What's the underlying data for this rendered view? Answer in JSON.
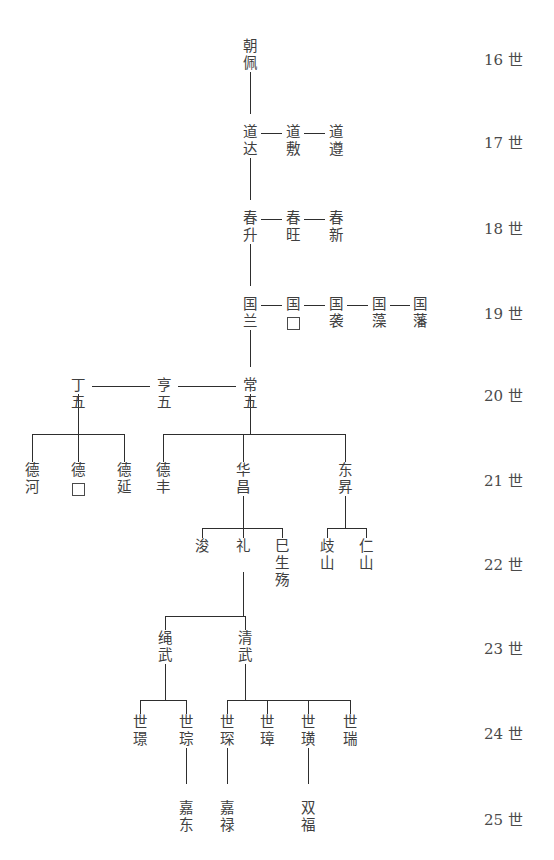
{
  "chart": {
    "type": "genealogy-tree",
    "line_color": "#2e2e2e",
    "text_color": "#3f3f3f",
    "background": "#ffffff"
  },
  "generation_labels": [
    {
      "id": "gen16",
      "text": "16 世",
      "y": 48
    },
    {
      "id": "gen17",
      "text": "17 世",
      "y": 131
    },
    {
      "id": "gen18",
      "text": "18 世",
      "y": 217
    },
    {
      "id": "gen19",
      "text": "19 世",
      "y": 302
    },
    {
      "id": "gen20",
      "text": "20 世",
      "y": 384
    },
    {
      "id": "gen21",
      "text": "21 世",
      "y": 469
    },
    {
      "id": "gen22",
      "text": "22 世",
      "y": 553
    },
    {
      "id": "gen23",
      "text": "23 世",
      "y": 637
    },
    {
      "id": "gen24",
      "text": "24 世",
      "y": 722
    },
    {
      "id": "gen25",
      "text": "25 世",
      "y": 808
    }
  ],
  "people": [
    {
      "id": "p16-1",
      "name": "朝佩",
      "chars": [
        "朝",
        "佩"
      ],
      "gen": 16,
      "x": 250,
      "y": 38
    },
    {
      "id": "p17-1",
      "name": "道达",
      "chars": [
        "道",
        "达"
      ],
      "gen": 17,
      "x": 250,
      "y": 124
    },
    {
      "id": "p17-2",
      "name": "道敷",
      "chars": [
        "道",
        "敷"
      ],
      "gen": 17,
      "x": 293,
      "y": 124
    },
    {
      "id": "p17-3",
      "name": "道遵",
      "chars": [
        "道",
        "遵"
      ],
      "gen": 17,
      "x": 336,
      "y": 124
    },
    {
      "id": "p18-1",
      "name": "春升",
      "chars": [
        "春",
        "升"
      ],
      "gen": 18,
      "x": 250,
      "y": 210
    },
    {
      "id": "p18-2",
      "name": "春旺",
      "chars": [
        "春",
        "旺"
      ],
      "gen": 18,
      "x": 293,
      "y": 210
    },
    {
      "id": "p18-3",
      "name": "春新",
      "chars": [
        "春",
        "新"
      ],
      "gen": 18,
      "x": 336,
      "y": 210
    },
    {
      "id": "p19-1",
      "name": "国兰",
      "chars": [
        "国",
        "兰"
      ],
      "gen": 19,
      "x": 250,
      "y": 296
    },
    {
      "id": "p19-2",
      "name": "国□",
      "chars": [
        "国",
        "□"
      ],
      "gen": 19,
      "x": 293,
      "y": 296
    },
    {
      "id": "p19-3",
      "name": "国袭",
      "chars": [
        "国",
        "袭"
      ],
      "gen": 19,
      "x": 336,
      "y": 296
    },
    {
      "id": "p19-4",
      "name": "国藻",
      "chars": [
        "国",
        "藻"
      ],
      "gen": 19,
      "x": 379,
      "y": 296
    },
    {
      "id": "p19-5",
      "name": "国藩",
      "chars": [
        "国",
        "藩"
      ],
      "gen": 19,
      "x": 420,
      "y": 296
    },
    {
      "id": "p20-1",
      "name": "丁五",
      "chars": [
        "丁",
        "五"
      ],
      "gen": 20,
      "x": 78,
      "y": 377
    },
    {
      "id": "p20-2",
      "name": "亨五",
      "chars": [
        "亨",
        "五"
      ],
      "gen": 20,
      "x": 164,
      "y": 377
    },
    {
      "id": "p20-3",
      "name": "常五",
      "chars": [
        "常",
        "五"
      ],
      "gen": 20,
      "x": 250,
      "y": 377
    },
    {
      "id": "p21-1",
      "name": "德河",
      "chars": [
        "德",
        "河"
      ],
      "gen": 21,
      "x": 32,
      "y": 462
    },
    {
      "id": "p21-2",
      "name": "德□",
      "chars": [
        "德",
        "□"
      ],
      "gen": 21,
      "x": 78,
      "y": 462
    },
    {
      "id": "p21-3",
      "name": "德延",
      "chars": [
        "德",
        "延"
      ],
      "gen": 21,
      "x": 124,
      "y": 462
    },
    {
      "id": "p21-4",
      "name": "德丰",
      "chars": [
        "德",
        "丰"
      ],
      "gen": 21,
      "x": 163,
      "y": 462
    },
    {
      "id": "p21-5",
      "name": "华昌",
      "chars": [
        "华",
        "昌"
      ],
      "gen": 21,
      "x": 243,
      "y": 462
    },
    {
      "id": "p21-6",
      "name": "东昇",
      "chars": [
        "东",
        "昇"
      ],
      "gen": 21,
      "x": 345,
      "y": 462
    },
    {
      "id": "p22-1",
      "name": "浚",
      "chars": [
        "浚"
      ],
      "gen": 22,
      "x": 202,
      "y": 538
    },
    {
      "id": "p22-2",
      "name": "礼",
      "chars": [
        "礼"
      ],
      "gen": 22,
      "x": 243,
      "y": 538
    },
    {
      "id": "p22-3",
      "name": "巳生殇",
      "chars": [
        "巳",
        "生",
        "殇"
      ],
      "gen": 22,
      "x": 282,
      "y": 538
    },
    {
      "id": "p22-4",
      "name": "歧山",
      "chars": [
        "歧",
        "山"
      ],
      "gen": 22,
      "x": 327,
      "y": 538
    },
    {
      "id": "p22-5",
      "name": "仁山",
      "chars": [
        "仁",
        "山"
      ],
      "gen": 22,
      "x": 366,
      "y": 538
    },
    {
      "id": "p23-1",
      "name": "绳武",
      "chars": [
        "绳",
        "武"
      ],
      "gen": 23,
      "x": 165,
      "y": 630
    },
    {
      "id": "p23-2",
      "name": "清武",
      "chars": [
        "清",
        "武"
      ],
      "gen": 23,
      "x": 245,
      "y": 630
    },
    {
      "id": "p24-1",
      "name": "世璟",
      "chars": [
        "世",
        "璟"
      ],
      "gen": 24,
      "x": 140,
      "y": 714
    },
    {
      "id": "p24-2",
      "name": "世琮",
      "chars": [
        "世",
        "琮"
      ],
      "gen": 24,
      "x": 186,
      "y": 714
    },
    {
      "id": "p24-3",
      "name": "世琛",
      "chars": [
        "世",
        "琛"
      ],
      "gen": 24,
      "x": 227,
      "y": 714
    },
    {
      "id": "p24-4",
      "name": "世璋",
      "chars": [
        "世",
        "璋"
      ],
      "gen": 24,
      "x": 267,
      "y": 714
    },
    {
      "id": "p24-5",
      "name": "世璜",
      "chars": [
        "世",
        "璜"
      ],
      "gen": 24,
      "x": 308,
      "y": 714
    },
    {
      "id": "p24-6",
      "name": "世瑞",
      "chars": [
        "世",
        "瑞"
      ],
      "gen": 24,
      "x": 350,
      "y": 714
    },
    {
      "id": "p25-1",
      "name": "嘉东",
      "chars": [
        "嘉",
        "东"
      ],
      "gen": 25,
      "x": 186,
      "y": 800
    },
    {
      "id": "p25-2",
      "name": "嘉禄",
      "chars": [
        "嘉",
        "禄"
      ],
      "gen": 25,
      "x": 227,
      "y": 800
    },
    {
      "id": "p25-3",
      "name": "双福",
      "chars": [
        "双",
        "福"
      ],
      "gen": 25,
      "x": 308,
      "y": 800
    }
  ],
  "sibling_links": [
    {
      "id": "s17-a",
      "from": "p17-1",
      "to": "p17-2",
      "x": 261,
      "y": 133,
      "w": 21
    },
    {
      "id": "s17-b",
      "from": "p17-2",
      "to": "p17-3",
      "x": 304,
      "y": 133,
      "w": 21
    },
    {
      "id": "s18-a",
      "from": "p18-1",
      "to": "p18-2",
      "x": 261,
      "y": 219,
      "w": 21
    },
    {
      "id": "s18-b",
      "from": "p18-2",
      "to": "p18-3",
      "x": 304,
      "y": 219,
      "w": 21
    },
    {
      "id": "s19-a",
      "from": "p19-1",
      "to": "p19-2",
      "x": 261,
      "y": 305,
      "w": 21
    },
    {
      "id": "s19-b",
      "from": "p19-2",
      "to": "p19-3",
      "x": 304,
      "y": 305,
      "w": 21
    },
    {
      "id": "s19-c",
      "from": "p19-3",
      "to": "p19-4",
      "x": 347,
      "y": 305,
      "w": 21
    },
    {
      "id": "s19-d",
      "from": "p19-4",
      "to": "p19-5",
      "x": 390,
      "y": 305,
      "w": 20
    },
    {
      "id": "s20-a",
      "from": "p20-1",
      "to": "p20-2",
      "x": 92,
      "y": 386,
      "w": 58
    },
    {
      "id": "s20-b",
      "from": "p20-2",
      "to": "p20-3",
      "x": 178,
      "y": 386,
      "w": 58
    }
  ],
  "parent_links": [
    {
      "id": "e16-17",
      "parent": "p16-1",
      "x": 250,
      "y": 72,
      "h": 42
    },
    {
      "id": "e17-18",
      "parent": "p17-1",
      "x": 250,
      "y": 158,
      "h": 42
    },
    {
      "id": "e18-19",
      "parent": "p18-1",
      "x": 250,
      "y": 244,
      "h": 42
    },
    {
      "id": "e19-20",
      "parent": "p19-1",
      "x": 250,
      "y": 330,
      "h": 37
    },
    {
      "id": "e21-22a",
      "parent": "p21-5",
      "x": 243,
      "y": 496,
      "h": 20
    },
    {
      "id": "e21-22b",
      "parent": "p21-6",
      "x": 345,
      "y": 496,
      "h": 20
    },
    {
      "id": "e22-23",
      "parent": "p22-2",
      "x": 243,
      "y": 572,
      "h": 32
    },
    {
      "id": "e23-24a",
      "parent": "p23-1",
      "x": 165,
      "y": 664,
      "h": 24
    },
    {
      "id": "e23-24b",
      "parent": "p23-2",
      "x": 245,
      "y": 664,
      "h": 24
    },
    {
      "id": "e24-25a",
      "parent": "p24-2",
      "x": 186,
      "y": 748,
      "h": 36
    },
    {
      "id": "e24-25b",
      "parent": "p24-3",
      "x": 227,
      "y": 748,
      "h": 36
    },
    {
      "id": "e24-25c",
      "parent": "p24-5",
      "x": 308,
      "y": 748,
      "h": 36
    }
  ],
  "bus_links": [
    {
      "id": "bus20-21-left",
      "parent": "p20-1",
      "x": 78,
      "y_top": 394,
      "drop": 40,
      "left": 32,
      "right": 124,
      "children": [
        "p21-1",
        "p21-2",
        "p21-3"
      ]
    },
    {
      "id": "bus20-21-right",
      "parent": "p20-3",
      "x": 250,
      "y_top": 394,
      "drop": 40,
      "left": 163,
      "right": 345,
      "children": [
        "p21-4",
        "p21-5",
        "p21-6"
      ]
    },
    {
      "id": "bus21-22-hua",
      "parent": "p21-5",
      "x": 243,
      "y_top": 516,
      "drop": 12,
      "left": 202,
      "right": 282,
      "children": [
        "p22-1",
        "p22-2",
        "p22-3"
      ]
    },
    {
      "id": "bus21-22-dong",
      "parent": "p21-6",
      "x": 345,
      "y_top": 516,
      "drop": 12,
      "left": 327,
      "right": 366,
      "children": [
        "p22-4",
        "p22-5"
      ]
    },
    {
      "id": "bus22-23",
      "parent": "p22-2",
      "x": 243,
      "y_top": 604,
      "drop": 12,
      "left": 165,
      "right": 245,
      "children": [
        "p23-1",
        "p23-2"
      ]
    },
    {
      "id": "bus23-24-sheng",
      "parent": "p23-1",
      "x": 165,
      "y_top": 688,
      "drop": 12,
      "left": 140,
      "right": 186,
      "children": [
        "p24-1",
        "p24-2"
      ]
    },
    {
      "id": "bus23-24-qing",
      "parent": "p23-2",
      "x": 245,
      "y_top": 688,
      "drop": 12,
      "left": 227,
      "right": 350,
      "children": [
        "p24-3",
        "p24-4",
        "p24-5",
        "p24-6"
      ]
    }
  ]
}
